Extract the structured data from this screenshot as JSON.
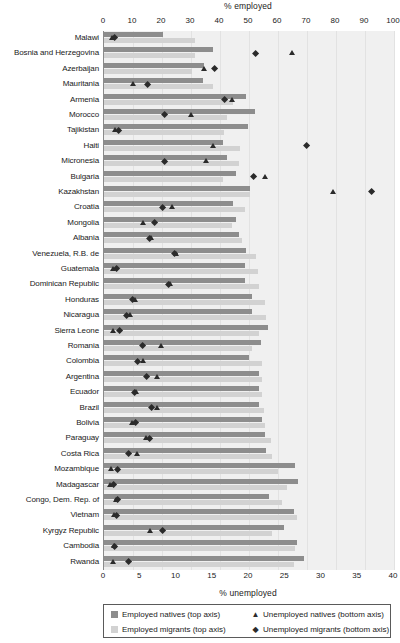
{
  "chart_data": {
    "type": "bar",
    "title": "",
    "top_axis": {
      "label": "% employed",
      "min": 0,
      "max": 100,
      "ticks": [
        0,
        10,
        20,
        30,
        40,
        50,
        60,
        70,
        80,
        90,
        100
      ]
    },
    "bottom_axis": {
      "label": "% unemployed",
      "min": 0,
      "max": 40,
      "ticks": [
        0,
        5,
        10,
        15,
        20,
        25,
        30,
        35,
        40
      ]
    },
    "grid": true,
    "legend_position": "bottom",
    "legend": [
      {
        "key": "employed_natives",
        "label": "Employed natives (top axis)",
        "glyph": "square",
        "color": "#8d8d8d"
      },
      {
        "key": "unemployed_natives",
        "label": "Unemployed natives (bottom axis)",
        "glyph": "triangle",
        "color": "#2b2b2b"
      },
      {
        "key": "employed_migrants",
        "label": "Employed migrants (top axis)",
        "glyph": "square",
        "color": "#d2d2d2"
      },
      {
        "key": "unemployed_migrants",
        "label": "Unemployed migrants (bottom axis)",
        "glyph": "diamond",
        "color": "#2b2b2b"
      }
    ],
    "series": [
      {
        "name": "Employed natives (top axis)",
        "axis": "top",
        "mark": "bar",
        "color": "#8d8d8d"
      },
      {
        "name": "Employed migrants (top axis)",
        "axis": "top",
        "mark": "bar",
        "color": "#d2d2d2"
      },
      {
        "name": "Unemployed natives (bottom axis)",
        "axis": "bottom",
        "mark": "triangle",
        "color": "#2b2b2b"
      },
      {
        "name": "Unemployed migrants (bottom axis)",
        "axis": "bottom",
        "mark": "diamond",
        "color": "#2b2b2b"
      }
    ],
    "categories": [
      "Malawi",
      "Bosnia and Herzegovina",
      "Azerbaijan",
      "Mauritania",
      "Armenia",
      "Morocco",
      "Tajikistan",
      "Haiti",
      "Micronesia",
      "Bulgaria",
      "Kazakhstan",
      "Croatia",
      "Mongolia",
      "Albania",
      "Venezuela, R.B. de",
      "Guatemala",
      "Dominican Republic",
      "Honduras",
      "Nicaragua",
      "Sierra Leone",
      "Romania",
      "Colombia",
      "Argentina",
      "Ecuador",
      "Brazil",
      "Bolivia",
      "Paraguay",
      "Costa Rica",
      "Mozambique",
      "Madagascar",
      "Congo, Dem. Rep. of",
      "Vietnam",
      "Kyrgyz Republic",
      "Cambodia",
      "Rwanda"
    ],
    "rows": [
      {
        "country": "Malawi",
        "employed_natives": 20.5,
        "employed_migrants": 31.5,
        "unemployed_natives": 1.1,
        "unemployed_migrants": 1.4
      },
      {
        "country": "Bosnia and Herzegovina",
        "employed_natives": 37.5,
        "employed_migrants": 31.5,
        "unemployed_natives": 26.0,
        "unemployed_migrants": 20.9
      },
      {
        "country": "Azerbaijan",
        "employed_natives": 34.5,
        "employed_migrants": 30.5,
        "unemployed_natives": 13.9,
        "unemployed_migrants": 15.3
      },
      {
        "country": "Mauritania",
        "employed_natives": 34.0,
        "employed_migrants": 37.5,
        "unemployed_natives": 4.0,
        "unemployed_migrants": 6.0
      },
      {
        "country": "Armenia",
        "employed_natives": 49.0,
        "employed_migrants": 44.5,
        "unemployed_natives": 17.7,
        "unemployed_migrants": 16.6
      },
      {
        "country": "Morocco",
        "employed_natives": 52.0,
        "employed_migrants": 42.5,
        "unemployed_natives": 12.0,
        "unemployed_migrants": 8.3
      },
      {
        "country": "Tajikistan",
        "employed_natives": 49.5,
        "employed_migrants": 41.5,
        "unemployed_natives": 1.6,
        "unemployed_migrants": 2.0
      },
      {
        "country": "Haiti",
        "employed_natives": 41.0,
        "employed_migrants": 47.0,
        "unemployed_natives": 15.1,
        "unemployed_migrants": 28.0
      },
      {
        "country": "Micronesia",
        "employed_natives": 42.5,
        "employed_migrants": 46.5,
        "unemployed_natives": 14.1,
        "unemployed_migrants": 8.3
      },
      {
        "country": "Bulgaria",
        "employed_natives": 45.5,
        "employed_migrants": 41.0,
        "unemployed_natives": 22.3,
        "unemployed_migrants": 20.6
      },
      {
        "country": "Kazakhstan",
        "employed_natives": 50.5,
        "employed_migrants": 50.5,
        "unemployed_natives": 31.7,
        "unemployed_migrants": 36.9
      },
      {
        "country": "Croatia",
        "employed_natives": 44.5,
        "employed_migrants": 48.5,
        "unemployed_natives": 9.4,
        "unemployed_migrants": 8.1
      },
      {
        "country": "Mongolia",
        "employed_natives": 45.5,
        "employed_migrants": 44.0,
        "unemployed_natives": 5.4,
        "unemployed_migrants": 7.0
      },
      {
        "country": "Albania",
        "employed_natives": 46.5,
        "employed_migrants": 47.5,
        "unemployed_natives": 6.6,
        "unemployed_migrants": 6.3
      },
      {
        "country": "Venezuela, R.B. de",
        "employed_natives": 49.0,
        "employed_migrants": 52.5,
        "unemployed_natives": 10.0,
        "unemployed_migrants": 9.7
      },
      {
        "country": "Guatemala",
        "employed_natives": 48.5,
        "employed_migrants": 53.0,
        "unemployed_natives": 1.3,
        "unemployed_migrants": 1.7
      },
      {
        "country": "Dominican Republic",
        "employed_natives": 48.5,
        "employed_migrants": 53.5,
        "unemployed_natives": 9.1,
        "unemployed_migrants": 8.9
      },
      {
        "country": "Honduras",
        "employed_natives": 51.0,
        "employed_migrants": 55.5,
        "unemployed_natives": 4.3,
        "unemployed_migrants": 4.0
      },
      {
        "country": "Nicaragua",
        "employed_natives": 51.0,
        "employed_migrants": 56.0,
        "unemployed_natives": 3.6,
        "unemployed_migrants": 3.1
      },
      {
        "country": "Sierra Leone",
        "employed_natives": 56.5,
        "employed_migrants": 53.5,
        "unemployed_natives": 1.3,
        "unemployed_migrants": 2.1
      },
      {
        "country": "Romania",
        "employed_natives": 54.0,
        "employed_migrants": 51.0,
        "unemployed_natives": 7.9,
        "unemployed_migrants": 5.3
      },
      {
        "country": "Colombia",
        "employed_natives": 50.0,
        "employed_migrants": 54.5,
        "unemployed_natives": 5.5,
        "unemployed_migrants": 4.6
      },
      {
        "country": "Argentina",
        "employed_natives": 53.5,
        "employed_migrants": 54.5,
        "unemployed_natives": 7.3,
        "unemployed_migrants": 5.9
      },
      {
        "country": "Ecuador",
        "employed_natives": 53.5,
        "employed_migrants": 54.5,
        "unemployed_natives": 4.4,
        "unemployed_migrants": 4.2
      },
      {
        "country": "Brazil",
        "employed_natives": 53.5,
        "employed_migrants": 55.0,
        "unemployed_natives": 7.3,
        "unemployed_migrants": 6.6
      },
      {
        "country": "Bolivia",
        "employed_natives": 54.5,
        "employed_migrants": 55.5,
        "unemployed_natives": 3.9,
        "unemployed_migrants": 4.3
      },
      {
        "country": "Paraguay",
        "employed_natives": 55.5,
        "employed_migrants": 57.5,
        "unemployed_natives": 5.9,
        "unemployed_migrants": 6.3
      },
      {
        "country": "Costa Rica",
        "employed_natives": 56.0,
        "employed_migrants": 58.0,
        "unemployed_natives": 4.6,
        "unemployed_migrants": 3.4
      },
      {
        "country": "Mozambique",
        "employed_natives": 66.0,
        "employed_migrants": 60.0,
        "unemployed_natives": 1.0,
        "unemployed_migrants": 1.9
      },
      {
        "country": "Madagascar",
        "employed_natives": 67.0,
        "employed_migrants": 63.0,
        "unemployed_natives": 0.9,
        "unemployed_migrants": 1.3
      },
      {
        "country": "Congo, Dem. Rep. of",
        "employed_natives": 57.0,
        "employed_migrants": 61.5,
        "unemployed_natives": 1.7,
        "unemployed_migrants": 1.9
      },
      {
        "country": "Vietnam",
        "employed_natives": 65.5,
        "employed_migrants": 66.5,
        "unemployed_natives": 1.4,
        "unemployed_migrants": 1.7
      },
      {
        "country": "Kyrgyz Republic",
        "employed_natives": 62.0,
        "employed_migrants": 58.0,
        "unemployed_natives": 6.4,
        "unemployed_migrants": 8.1
      },
      {
        "country": "Cambodia",
        "employed_natives": 66.5,
        "employed_migrants": 66.0,
        "unemployed_natives": 1.4,
        "unemployed_migrants": 1.5
      },
      {
        "country": "Rwanda",
        "employed_natives": 69.0,
        "employed_migrants": 65.5,
        "unemployed_natives": 1.3,
        "unemployed_migrants": 3.4
      }
    ]
  }
}
